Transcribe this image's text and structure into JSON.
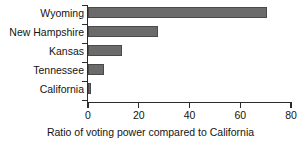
{
  "chart_data": {
    "type": "bar",
    "orientation": "horizontal",
    "title": "",
    "xlabel": "Ratio of voting power compared to California",
    "ylabel": "",
    "categories": [
      "Wyoming",
      "New Hampshire",
      "Kansas",
      "Tennessee",
      "California"
    ],
    "values": [
      70.5,
      27.5,
      13.4,
      6.3,
      1.0
    ],
    "xlim": [
      0,
      80
    ],
    "xticks": [
      0,
      20,
      40,
      60,
      80
    ],
    "xtick_labels": [
      "0",
      "20",
      "40",
      "60",
      "80"
    ],
    "grid": false,
    "legend": false,
    "bar_color": "#6b6b6b",
    "axis_color": "#2b2b2b",
    "background_color": "#ffffff"
  }
}
